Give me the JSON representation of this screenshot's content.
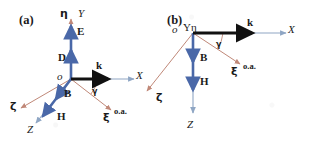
{
  "figure": {
    "background": "#ffffff",
    "colors": {
      "lab_axis": "#8fa6c4",
      "crystal_axis": "#c08878",
      "field_vector": "#4a68a8",
      "wave_vector": "#111111",
      "text": "#1a1a1a"
    }
  },
  "panels": [
    {
      "id": "a",
      "tag": "(a)",
      "origin_label": "o",
      "angle_label": "γ",
      "lab_axes": [
        {
          "name": "X",
          "label": "X"
        },
        {
          "name": "Y",
          "label": "Y"
        },
        {
          "name": "Z",
          "label": "Z"
        }
      ],
      "crystal_axes": [
        {
          "name": "xi",
          "label": "ξ",
          "note": "o.a."
        },
        {
          "name": "eta",
          "label": "η"
        },
        {
          "name": "zeta",
          "label": "ζ"
        }
      ],
      "vectors": [
        {
          "name": "k",
          "label": "k"
        },
        {
          "name": "E",
          "label": "E"
        },
        {
          "name": "D",
          "label": "D"
        },
        {
          "name": "B",
          "label": "B"
        },
        {
          "name": "H",
          "label": "H"
        }
      ]
    },
    {
      "id": "b",
      "tag": "(b)",
      "origin_label": "o",
      "origin_axes_label": "Yη",
      "angle_label": "γ",
      "lab_axes": [
        {
          "name": "X",
          "label": "X"
        },
        {
          "name": "Z",
          "label": "Z"
        }
      ],
      "crystal_axes": [
        {
          "name": "xi",
          "label": "ξ",
          "note": "o.a."
        },
        {
          "name": "zeta",
          "label": "ζ"
        }
      ],
      "vectors": [
        {
          "name": "k",
          "label": "k"
        },
        {
          "name": "B",
          "label": "B"
        },
        {
          "name": "H",
          "label": "H"
        }
      ]
    }
  ]
}
